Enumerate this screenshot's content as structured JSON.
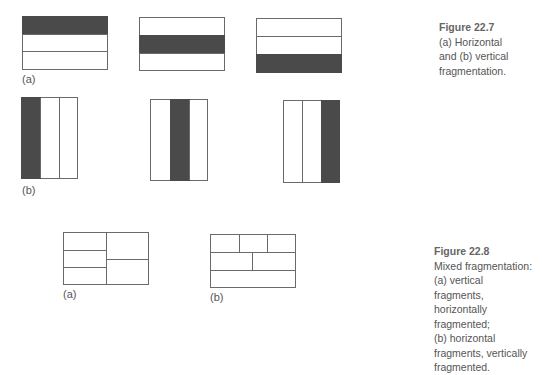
{
  "figures": [
    {
      "id": "22.7",
      "caption_title": "Figure 22.7",
      "caption_lines": [
        "(a) Horizontal",
        "and (b) vertical",
        "fragmentation."
      ],
      "parts": [
        {
          "label": "(a)",
          "kind": "horizontal",
          "fragments": 3,
          "highlighted": [
            0,
            1,
            2
          ]
        },
        {
          "label": "(b)",
          "kind": "vertical",
          "fragments": 3,
          "highlighted": [
            0,
            1,
            2
          ]
        }
      ]
    },
    {
      "id": "22.8",
      "caption_title": "Figure 22.8",
      "caption_lines": [
        "Mixed fragmentation:",
        "(a) vertical",
        "fragments,",
        "horizontally",
        "fragmented;",
        "(b) horizontal",
        "fragments, vertically",
        "fragmented."
      ],
      "parts": [
        {
          "label": "(a)",
          "kind": "vertical fragments, horizontally fragmented"
        },
        {
          "label": "(b)",
          "kind": "horizontal fragments, vertically fragmented"
        }
      ]
    }
  ],
  "colors": {
    "fill": "#4a4a4a",
    "line": "#6a6a6a",
    "text": "#555555"
  }
}
